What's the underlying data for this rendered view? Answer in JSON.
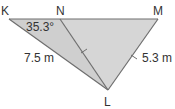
{
  "figure": {
    "type": "triangle-diagram",
    "vertices": {
      "K": {
        "label": "K"
      },
      "N": {
        "label": "N"
      },
      "M": {
        "label": "M"
      },
      "L": {
        "label": "L"
      }
    },
    "measurements": {
      "angle_K": "35.3°",
      "side_KL": "7.5 m",
      "side_ML": "5.3 m"
    },
    "equal_marks": [
      "NL",
      "ML"
    ],
    "colors": {
      "fill": "#cfcfcf",
      "fill_right": "#d6d6d6",
      "stroke": "#6e6e6e",
      "text": "#333333"
    }
  }
}
